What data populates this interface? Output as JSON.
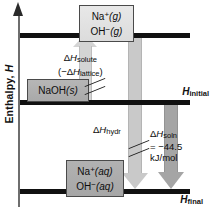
{
  "chart_data": {
    "type": "diagram",
    "ylabel": "Enthalpy, H",
    "levels": [
      {
        "id": "gas",
        "label": "",
        "species": [
          "Na+(g)",
          "OH-(g)"
        ]
      },
      {
        "id": "initial",
        "label": "Hinitial",
        "species": [
          "NaOH(s)"
        ]
      },
      {
        "id": "final",
        "label": "Hfinal",
        "species": [
          "Na+(aq)",
          "OH-(aq)"
        ]
      }
    ],
    "transitions": [
      {
        "name": "solute",
        "label": "ΔHsolute (-ΔHlattice)",
        "direction": "up",
        "from": "initial",
        "to": "gas"
      },
      {
        "name": "hydration",
        "label": "ΔHhydr",
        "direction": "down",
        "from": "gas",
        "to": "final"
      },
      {
        "name": "solution",
        "label": "ΔHsoln = -44.5 kJ/mol",
        "value": -44.5,
        "units": "kJ/mol",
        "direction": "down",
        "from": "initial",
        "to": "final"
      }
    ],
    "colors": {
      "level_line": "#111111",
      "arrow_solute": "#d4d4d4",
      "arrow_hydr": "#c9c9c9",
      "arrow_soln": "#a5a5a5",
      "box_gas": "#e0e0e0",
      "box_condensed": "#acacac",
      "axis": "#6e6e6e"
    }
  },
  "axis": {
    "title_text": "Enthalpy,",
    "title_symbol": "H"
  },
  "boxes": {
    "gas": {
      "line1_species": "Na",
      "line1_charge": "+",
      "line1_state": "(g)",
      "line2_species": "OH",
      "line2_charge": "−",
      "line2_state": "(g)"
    },
    "solid": {
      "formula": "NaOH",
      "state": "(s)"
    },
    "aqueous": {
      "line1_species": "Na",
      "line1_charge": "+",
      "line1_state": "(aq)",
      "line2_species": "OH",
      "line2_charge": "−",
      "line2_state": "(aq)"
    }
  },
  "levels": {
    "initial_delta": "Δ",
    "initial_symbol": "H",
    "initial_sub": "initial",
    "final_symbol": "H",
    "final_sub": "final"
  },
  "annotations": {
    "solute": {
      "delta": "Δ",
      "symbol": "H",
      "sub": "solute",
      "line2_open": "(−Δ",
      "line2_symbol": "H",
      "line2_sub": "lattice",
      "line2_close": ")"
    },
    "hydr": {
      "delta": "Δ",
      "symbol": "H",
      "sub": "hydr"
    },
    "soln": {
      "delta": "Δ",
      "symbol": "H",
      "sub": "soln",
      "value": "= −44.5",
      "units": "kJ/mol"
    }
  }
}
